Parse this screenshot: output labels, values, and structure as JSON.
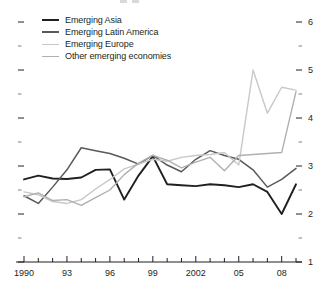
{
  "chart_data": {
    "type": "line",
    "title": "",
    "subtitle": "",
    "xlabel": "",
    "ylabel": "",
    "xlim": [
      1990,
      2009
    ],
    "ylim": [
      1,
      6
    ],
    "ytick_labels": [
      "1",
      "2",
      "3",
      "4",
      "5",
      "6"
    ],
    "ytick_values": [
      1,
      2,
      3,
      4,
      5,
      6
    ],
    "yminor_step": 0.5,
    "ytick_side": "both",
    "xtick_labels": [
      "1990",
      "93",
      "96",
      "99",
      "2002",
      "05",
      "08"
    ],
    "xtick_values": [
      1990,
      1993,
      1996,
      1999,
      2002,
      2005,
      2008
    ],
    "xminor_step": 1,
    "grid": false,
    "legend_position": "top-left",
    "x": [
      1990,
      1991,
      1992,
      1993,
      1994,
      1995,
      1996,
      1997,
      1998,
      1999,
      2000,
      2001,
      2002,
      2003,
      2004,
      2005,
      2006,
      2007,
      2008,
      2009
    ],
    "series": [
      {
        "name": "Emerging Asia",
        "color": "#231f20",
        "width": 1.9,
        "values": [
          2.72,
          2.8,
          2.74,
          2.73,
          2.76,
          2.92,
          2.93,
          2.3,
          2.8,
          3.2,
          2.62,
          2.6,
          2.58,
          2.62,
          2.6,
          2.56,
          2.62,
          2.46,
          2.0,
          2.62
        ]
      },
      {
        "name": "Emerging Latin America",
        "color": "#58595b",
        "width": 1.5,
        "values": [
          2.38,
          2.22,
          2.56,
          2.92,
          3.38,
          3.32,
          3.26,
          3.16,
          3.04,
          3.22,
          3.02,
          2.88,
          3.14,
          3.32,
          3.22,
          3.14,
          2.92,
          2.56,
          2.72,
          2.95
        ]
      },
      {
        "name": "Emerging Europe",
        "color": "#c8c8c8",
        "width": 1.4,
        "values": [
          2.46,
          2.4,
          2.26,
          2.22,
          2.3,
          2.52,
          2.72,
          2.94,
          3.04,
          3.14,
          3.1,
          3.18,
          3.22,
          3.24,
          3.28,
          3.02,
          5.0,
          4.1,
          4.64,
          4.58
        ]
      },
      {
        "name": "Other emerging economies",
        "color": "#b0b0b0",
        "width": 1.4,
        "values": [
          2.36,
          2.44,
          2.28,
          2.3,
          2.18,
          2.34,
          2.5,
          2.82,
          3.06,
          3.22,
          3.12,
          2.96,
          3.08,
          3.18,
          2.9,
          3.22,
          3.24,
          3.26,
          3.28,
          4.55
        ]
      }
    ]
  },
  "legend": {
    "items": [
      {
        "label": "Emerging Asia"
      },
      {
        "label": "Emerging Latin America"
      },
      {
        "label": "Emerging Europe"
      },
      {
        "label": "Other emerging economies"
      }
    ]
  }
}
